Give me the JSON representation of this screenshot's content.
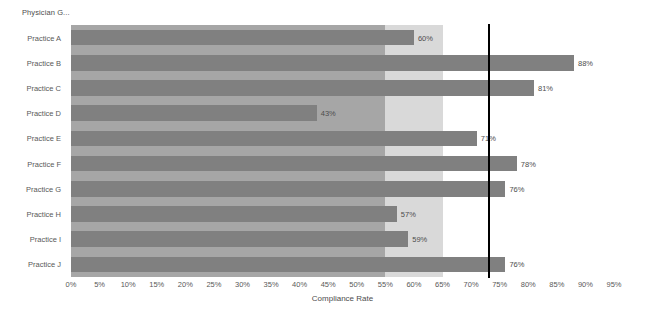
{
  "header": {
    "title": "Physician G..."
  },
  "axis": {
    "x_title": "Compliance Rate",
    "x_ticks": [
      "0%",
      "5%",
      "10%",
      "15%",
      "20%",
      "25%",
      "30%",
      "35%",
      "40%",
      "45%",
      "50%",
      "55%",
      "60%",
      "65%",
      "70%",
      "75%",
      "80%",
      "85%",
      "90%",
      "95%"
    ]
  },
  "colors": {
    "bar": "#808080",
    "band_low": "#a6a6a6",
    "band_mid": "#d9d9d9",
    "band_high": "#ffffff",
    "reference_line": "#000000",
    "text": "#595959"
  },
  "chart_data": {
    "type": "bar",
    "orientation": "horizontal",
    "title": "Physician G...",
    "xlabel": "Compliance Rate",
    "ylabel": "",
    "xlim": [
      0,
      95
    ],
    "xtick_step": 5,
    "grid": false,
    "legend": "none",
    "categories": [
      "Practice A",
      "Practice B",
      "Practice C",
      "Practice D",
      "Practice E",
      "Practice F",
      "Practice G",
      "Practice H",
      "Practice I",
      "Practice J"
    ],
    "values": [
      60,
      88,
      81,
      43,
      71,
      78,
      76,
      57,
      59,
      76
    ],
    "data_labels": [
      "60%",
      "88%",
      "81%",
      "43%",
      "71%",
      "78%",
      "76%",
      "57%",
      "59%",
      "76%"
    ],
    "reference_line": {
      "value": 73,
      "orientation": "vertical",
      "color": "#000000"
    },
    "background_bands": [
      {
        "from": 0,
        "to": 55,
        "color": "#a6a6a6"
      },
      {
        "from": 55,
        "to": 65,
        "color": "#d9d9d9"
      },
      {
        "from": 65,
        "to": 95,
        "color": "#ffffff"
      }
    ]
  }
}
